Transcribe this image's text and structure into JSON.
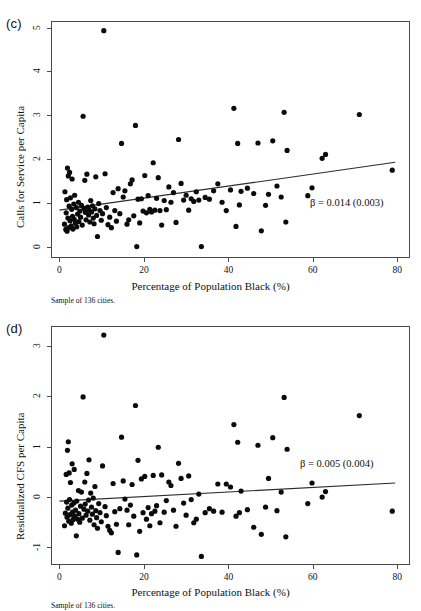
{
  "figure": {
    "shared_xlabel": "Percentage of Population Black (%)",
    "sample_note": "Sample of 136 cities.",
    "top_cutoff_trace": ""
  },
  "panels": [
    {
      "tag": "(c)",
      "beta_annotation": "β = 0.014 (0.003)"
    },
    {
      "tag": "(d)",
      "beta_annotation": "β = 0.005 (0.004)"
    }
  ],
  "chart_data": [
    {
      "type": "scatter",
      "panel": "(c)",
      "title": "",
      "xlabel": "Percentage of Population Black (%)",
      "ylabel": "Calls for Service per Capita",
      "xlim": [
        -2.0,
        83.0
      ],
      "ylim": [
        -0.25,
        5.15
      ],
      "xticks": [
        0,
        20,
        40,
        60,
        80
      ],
      "yticks": [
        0,
        1,
        2,
        3,
        4,
        5
      ],
      "grid": false,
      "legend": null,
      "annotations": [
        {
          "text": "β = 0.014 (0.003)",
          "x": 62.0,
          "y": 0.88
        }
      ],
      "fit_line": {
        "label": "OLS fit",
        "slope": 0.014,
        "se": 0.003,
        "x": [
          0.0,
          79.5
        ],
        "y": [
          0.84,
          1.93
        ]
      },
      "n": 136,
      "points": [
        [
          1.2,
          0.52
        ],
        [
          1.3,
          1.26
        ],
        [
          1.5,
          0.4
        ],
        [
          1.6,
          0.78
        ],
        [
          1.7,
          1.08
        ],
        [
          1.8,
          0.36
        ],
        [
          1.9,
          1.8
        ],
        [
          2.0,
          0.66
        ],
        [
          2.1,
          1.62
        ],
        [
          2.2,
          0.44
        ],
        [
          2.3,
          0.93
        ],
        [
          2.4,
          1.7
        ],
        [
          2.5,
          0.6
        ],
        [
          2.6,
          1.12
        ],
        [
          2.8,
          0.48
        ],
        [
          2.9,
          0.86
        ],
        [
          3.0,
          1.55
        ],
        [
          3.1,
          0.7
        ],
        [
          3.2,
          0.41
        ],
        [
          3.4,
          0.98
        ],
        [
          3.5,
          0.63
        ],
        [
          3.6,
          1.18
        ],
        [
          3.8,
          0.55
        ],
        [
          4.0,
          0.9
        ],
        [
          4.1,
          0.46
        ],
        [
          4.3,
          0.75
        ],
        [
          4.5,
          1.02
        ],
        [
          4.6,
          0.58
        ],
        [
          4.8,
          0.82
        ],
        [
          5.0,
          0.68
        ],
        [
          5.2,
          0.95
        ],
        [
          5.4,
          0.5
        ],
        [
          5.6,
          2.98
        ],
        [
          5.8,
          0.88
        ],
        [
          6.0,
          1.52
        ],
        [
          6.1,
          0.79
        ],
        [
          6.3,
          0.62
        ],
        [
          6.5,
          1.66
        ],
        [
          6.7,
          0.91
        ],
        [
          6.9,
          0.73
        ],
        [
          7.0,
          0.84
        ],
        [
          7.2,
          0.57
        ],
        [
          7.4,
          1.06
        ],
        [
          7.6,
          0.8
        ],
        [
          7.8,
          0.94
        ],
        [
          8.0,
          0.66
        ],
        [
          8.2,
          0.53
        ],
        [
          8.4,
          0.87
        ],
        [
          8.6,
          1.6
        ],
        [
          8.8,
          0.72
        ],
        [
          9.0,
          0.24
        ],
        [
          9.3,
          0.99
        ],
        [
          9.6,
          0.83
        ],
        [
          9.9,
          0.61
        ],
        [
          10.2,
          0.76
        ],
        [
          10.5,
          4.93
        ],
        [
          10.8,
          1.67
        ],
        [
          11.1,
          0.9
        ],
        [
          11.5,
          0.51
        ],
        [
          11.9,
          0.68
        ],
        [
          12.3,
          0.44
        ],
        [
          12.7,
          1.24
        ],
        [
          13.1,
          0.83
        ],
        [
          13.5,
          0.59
        ],
        [
          13.9,
          1.33
        ],
        [
          14.3,
          0.76
        ],
        [
          14.7,
          2.36
        ],
        [
          15.1,
          1.14
        ],
        [
          15.5,
          1.28
        ],
        [
          16.0,
          0.52
        ],
        [
          16.4,
          0.62
        ],
        [
          16.8,
          1.44
        ],
        [
          17.2,
          1.53
        ],
        [
          17.6,
          0.71
        ],
        [
          18.0,
          2.77
        ],
        [
          18.3,
          0.01
        ],
        [
          18.6,
          1.09
        ],
        [
          19.0,
          0.55
        ],
        [
          19.4,
          1.1
        ],
        [
          19.8,
          0.82
        ],
        [
          20.2,
          1.63
        ],
        [
          20.6,
          0.78
        ],
        [
          21.0,
          1.17
        ],
        [
          21.4,
          0.86
        ],
        [
          21.8,
          0.8
        ],
        [
          22.2,
          1.92
        ],
        [
          22.6,
          0.84
        ],
        [
          23.0,
          1.11
        ],
        [
          23.4,
          1.58
        ],
        [
          23.8,
          0.83
        ],
        [
          24.2,
          0.5
        ],
        [
          24.8,
          1.06
        ],
        [
          25.3,
          0.85
        ],
        [
          25.9,
          1.37
        ],
        [
          26.4,
          1.02
        ],
        [
          27.0,
          1.24
        ],
        [
          27.6,
          0.56
        ],
        [
          28.2,
          2.45
        ],
        [
          28.8,
          1.45
        ],
        [
          29.4,
          1.07
        ],
        [
          30.0,
          1.18
        ],
        [
          30.6,
          0.84
        ],
        [
          31.2,
          1.1
        ],
        [
          31.8,
          1.04
        ],
        [
          32.4,
          1.26
        ],
        [
          33.0,
          1.07
        ],
        [
          33.6,
          0.01
        ],
        [
          34.5,
          1.13
        ],
        [
          35.5,
          1.09
        ],
        [
          36.5,
          1.28
        ],
        [
          37.5,
          1.44
        ],
        [
          38.5,
          1.02
        ],
        [
          39.5,
          0.83
        ],
        [
          40.5,
          1.3
        ],
        [
          41.3,
          3.16
        ],
        [
          41.8,
          0.47
        ],
        [
          42.2,
          2.36
        ],
        [
          42.6,
          0.96
        ],
        [
          43.0,
          1.27
        ],
        [
          44.5,
          1.34
        ],
        [
          46.0,
          1.22
        ],
        [
          47.0,
          2.37
        ],
        [
          47.8,
          0.37
        ],
        [
          48.8,
          0.95
        ],
        [
          49.5,
          1.2
        ],
        [
          50.5,
          2.42
        ],
        [
          51.5,
          1.39
        ],
        [
          52.5,
          1.14
        ],
        [
          53.2,
          3.07
        ],
        [
          53.6,
          0.57
        ],
        [
          53.9,
          2.2
        ],
        [
          58.8,
          1.17
        ],
        [
          59.8,
          1.35
        ],
        [
          62.2,
          2.02
        ],
        [
          63.0,
          2.11
        ],
        [
          71.0,
          3.02
        ],
        [
          78.8,
          1.75
        ]
      ]
    },
    {
      "type": "scatter",
      "panel": "(d)",
      "title": "",
      "xlabel": "Percentage of Population Black (%)",
      "ylabel": "Residualized CFS per Capita",
      "xlim": [
        -2.0,
        83.0
      ],
      "ylim": [
        -1.35,
        3.4
      ],
      "xticks": [
        0,
        20,
        40,
        60,
        80
      ],
      "yticks": [
        -1,
        0,
        1,
        2,
        3
      ],
      "grid": false,
      "legend": null,
      "annotations": [
        {
          "text": "β = 0.005 (0.004)",
          "x": 62.0,
          "y": 0.62
        }
      ],
      "fit_line": {
        "label": "OLS fit",
        "slope": 0.005,
        "se": 0.004,
        "x": [
          0.0,
          79.5
        ],
        "y": [
          -0.08,
          0.28
        ]
      },
      "n": 136,
      "points": [
        [
          1.2,
          -0.57
        ],
        [
          1.4,
          -0.32
        ],
        [
          1.6,
          0.45
        ],
        [
          1.7,
          -0.1
        ],
        [
          1.8,
          -0.4
        ],
        [
          1.9,
          0.93
        ],
        [
          2.0,
          -0.22
        ],
        [
          2.1,
          1.1
        ],
        [
          2.2,
          -0.48
        ],
        [
          2.3,
          0.48
        ],
        [
          2.4,
          -0.05
        ],
        [
          2.5,
          -0.35
        ],
        [
          2.6,
          0.29
        ],
        [
          2.8,
          -0.52
        ],
        [
          2.9,
          -0.16
        ],
        [
          3.0,
          0.66
        ],
        [
          3.1,
          -0.3
        ],
        [
          3.2,
          -0.45
        ],
        [
          3.4,
          -0.12
        ],
        [
          3.5,
          0.55
        ],
        [
          3.6,
          -0.38
        ],
        [
          3.8,
          -0.26
        ],
        [
          4.0,
          -0.77
        ],
        [
          4.1,
          -0.08
        ],
        [
          4.3,
          -0.44
        ],
        [
          4.5,
          0.13
        ],
        [
          4.6,
          -0.33
        ],
        [
          4.8,
          -0.5
        ],
        [
          5.0,
          -0.18
        ],
        [
          5.2,
          0.1
        ],
        [
          5.4,
          -0.42
        ],
        [
          5.6,
          1.99
        ],
        [
          5.8,
          -0.24
        ],
        [
          6.0,
          0.3
        ],
        [
          6.1,
          -0.14
        ],
        [
          6.3,
          -0.36
        ],
        [
          6.5,
          0.47
        ],
        [
          6.7,
          -0.28
        ],
        [
          6.9,
          -0.06
        ],
        [
          7.0,
          0.74
        ],
        [
          7.2,
          -0.46
        ],
        [
          7.4,
          0.08
        ],
        [
          7.6,
          -0.2
        ],
        [
          7.8,
          -0.34
        ],
        [
          8.0,
          -0.02
        ],
        [
          8.2,
          -0.55
        ],
        [
          8.4,
          0.21
        ],
        [
          8.6,
          -0.27
        ],
        [
          8.8,
          -0.41
        ],
        [
          9.0,
          -0.62
        ],
        [
          9.3,
          -0.13
        ],
        [
          9.6,
          -0.31
        ],
        [
          9.9,
          -0.49
        ],
        [
          10.2,
          0.62
        ],
        [
          10.5,
          3.22
        ],
        [
          10.8,
          -0.19
        ],
        [
          11.1,
          -0.37
        ],
        [
          11.5,
          -0.58
        ],
        [
          11.9,
          -0.66
        ],
        [
          12.3,
          -0.71
        ],
        [
          12.7,
          0.27
        ],
        [
          13.1,
          -0.29
        ],
        [
          13.5,
          -0.54
        ],
        [
          13.9,
          -1.1
        ],
        [
          14.3,
          -0.23
        ],
        [
          14.7,
          1.19
        ],
        [
          15.1,
          0.32
        ],
        [
          15.5,
          -0.04
        ],
        [
          16.0,
          -0.26
        ],
        [
          16.4,
          -0.55
        ],
        [
          16.8,
          -0.16
        ],
        [
          17.2,
          0.25
        ],
        [
          17.6,
          -0.38
        ],
        [
          18.0,
          1.82
        ],
        [
          18.3,
          -1.15
        ],
        [
          18.6,
          0.73
        ],
        [
          19.0,
          -0.68
        ],
        [
          19.4,
          0.36
        ],
        [
          19.8,
          -0.31
        ],
        [
          20.2,
          0.41
        ],
        [
          20.6,
          -0.44
        ],
        [
          21.0,
          -0.21
        ],
        [
          21.4,
          -0.57
        ],
        [
          21.8,
          -0.33
        ],
        [
          22.2,
          0.43
        ],
        [
          22.6,
          -0.28
        ],
        [
          23.0,
          -0.17
        ],
        [
          23.4,
          0.99
        ],
        [
          23.8,
          -0.51
        ],
        [
          24.2,
          0.44
        ],
        [
          24.8,
          -0.3
        ],
        [
          25.3,
          -0.07
        ],
        [
          25.9,
          0.3
        ],
        [
          26.4,
          0.23
        ],
        [
          27.0,
          -0.26
        ],
        [
          27.6,
          -0.58
        ],
        [
          28.2,
          0.67
        ],
        [
          28.8,
          0.37
        ],
        [
          29.4,
          -0.12
        ],
        [
          30.0,
          -0.36
        ],
        [
          30.6,
          0.42
        ],
        [
          31.2,
          -0.05
        ],
        [
          31.8,
          -0.51
        ],
        [
          32.4,
          -0.44
        ],
        [
          33.0,
          0.06
        ],
        [
          33.6,
          -1.18
        ],
        [
          34.5,
          -0.31
        ],
        [
          35.5,
          -0.23
        ],
        [
          36.5,
          -0.28
        ],
        [
          37.5,
          0.26
        ],
        [
          38.5,
          -0.3
        ],
        [
          39.5,
          0.26
        ],
        [
          40.5,
          0.2
        ],
        [
          41.3,
          1.44
        ],
        [
          41.8,
          -0.38
        ],
        [
          42.2,
          1.09
        ],
        [
          42.6,
          -0.31
        ],
        [
          43.0,
          0.12
        ],
        [
          44.5,
          -0.25
        ],
        [
          46.0,
          -0.6
        ],
        [
          47.0,
          1.03
        ],
        [
          47.8,
          -0.74
        ],
        [
          48.8,
          -0.2
        ],
        [
          49.5,
          0.37
        ],
        [
          50.5,
          1.18
        ],
        [
          51.5,
          -0.27
        ],
        [
          52.5,
          0.1
        ],
        [
          53.2,
          1.98
        ],
        [
          53.6,
          -0.79
        ],
        [
          53.9,
          0.95
        ],
        [
          58.8,
          -0.13
        ],
        [
          59.8,
          0.28
        ],
        [
          62.2,
          0.0
        ],
        [
          63.0,
          0.11
        ],
        [
          71.0,
          1.62
        ],
        [
          78.8,
          -0.28
        ]
      ]
    }
  ]
}
